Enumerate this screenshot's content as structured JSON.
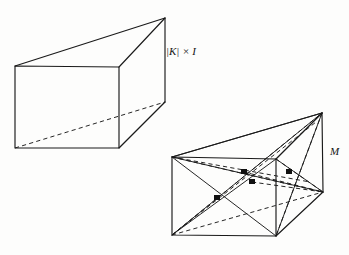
{
  "figure": {
    "type": "geometric-diagram",
    "background_color": "#fdfdfc",
    "ink_color": "#1a1a1a",
    "labels": {
      "left_shape": {
        "text": "|K| × I",
        "parts": {
          "bar_open": "|",
          "k": "K",
          "bar_close": "|",
          "times": "×",
          "i": "I"
        },
        "x": 166,
        "y": 46
      },
      "right_shape": {
        "text": "M",
        "x": 330,
        "y": 146
      }
    },
    "shapes": [
      {
        "name": "left-prism",
        "label": "|K| × I",
        "vertices": {
          "front_top_left": [
            15,
            66
          ],
          "front_top_right": [
            119,
            67
          ],
          "front_bottom_right": [
            119,
            148
          ],
          "front_bottom_left": [
            15,
            148
          ],
          "back_top_right": [
            165,
            18
          ],
          "back_bottom_right": [
            165,
            102
          ]
        },
        "solid_edges": [
          [
            "front_top_left",
            "front_top_right"
          ],
          [
            "front_top_right",
            "front_bottom_right"
          ],
          [
            "front_bottom_right",
            "front_bottom_left"
          ],
          [
            "front_bottom_left",
            "front_top_left"
          ],
          [
            "front_top_left",
            "back_top_right"
          ],
          [
            "front_top_right",
            "back_top_right"
          ],
          [
            "back_top_right",
            "back_bottom_right"
          ],
          [
            "front_bottom_right",
            "back_bottom_right"
          ]
        ],
        "dashed_edges": [
          [
            "front_bottom_left",
            "back_bottom_right"
          ]
        ]
      },
      {
        "name": "right-prism",
        "label": "M",
        "vertices": {
          "front_top_left": [
            172,
            157
          ],
          "front_top_right": [
            276,
            159
          ],
          "front_bottom_right": [
            276,
            236
          ],
          "front_bottom_left": [
            172,
            235
          ],
          "back_top_right": [
            322,
            113
          ],
          "back_bottom_right": [
            323,
            192
          ]
        },
        "solid_edges": [
          [
            "front_top_left",
            "front_top_right"
          ],
          [
            "front_top_right",
            "front_bottom_right"
          ],
          [
            "front_bottom_right",
            "front_bottom_left"
          ],
          [
            "front_bottom_left",
            "front_top_left"
          ],
          [
            "front_top_left",
            "back_top_right"
          ],
          [
            "front_top_right",
            "back_top_right"
          ],
          [
            "back_top_right",
            "back_bottom_right"
          ],
          [
            "front_bottom_right",
            "back_bottom_right"
          ]
        ],
        "solid_diagonals": [
          [
            "front_top_left",
            "front_bottom_right"
          ],
          [
            "front_bottom_left",
            "front_top_right"
          ],
          [
            "front_top_left",
            "back_bottom_right"
          ],
          [
            "front_bottom_left",
            "back_top_right"
          ],
          [
            "front_bottom_right",
            "back_top_right"
          ],
          [
            "front_top_right",
            "back_bottom_right"
          ]
        ],
        "dashed_diagonals": [
          [
            "front_bottom_left",
            "back_bottom_right"
          ],
          [
            "front_top_left",
            "back_top_right_inner"
          ],
          [
            "front_bottom_left",
            "back_top_right_inner2"
          ],
          [
            "front_top_right",
            "back_bottom_right_inner"
          ],
          [
            "back_top_right",
            "front_bottom_right_inner"
          ]
        ],
        "marked_points": [
          {
            "id": "p1",
            "x": 244,
            "y": 172
          },
          {
            "id": "p2",
            "x": 252,
            "y": 182
          },
          {
            "id": "p3",
            "x": 217,
            "y": 198
          },
          {
            "id": "p4",
            "x": 289,
            "y": 172
          }
        ]
      }
    ]
  }
}
